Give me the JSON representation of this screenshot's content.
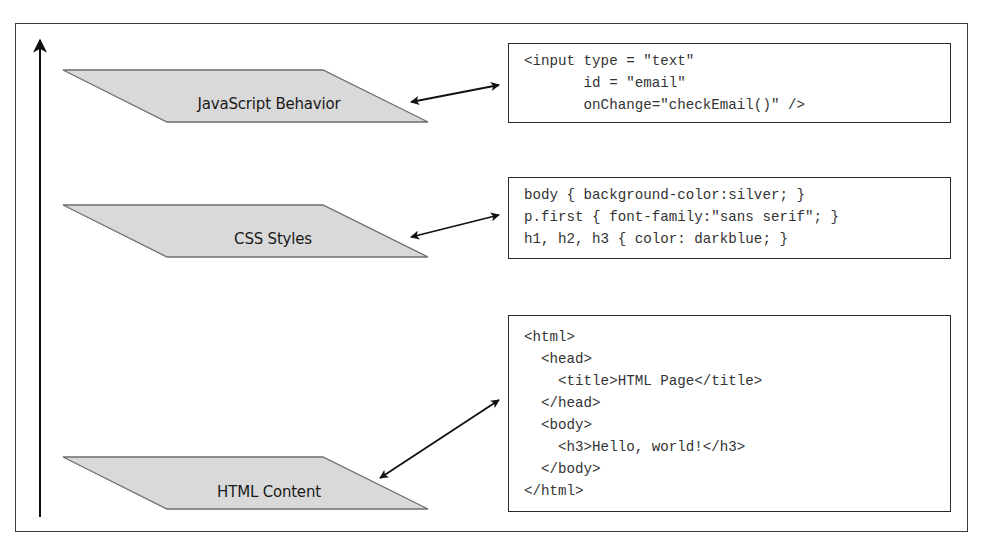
{
  "diagram": {
    "axis": {
      "direction": "up"
    },
    "layers": [
      {
        "id": "javascript",
        "label": "JavaScript Behavior",
        "code_lines": [
          "<input type = \"text\"",
          "       id = \"email\"",
          "       onChange=\"checkEmail()\" />"
        ]
      },
      {
        "id": "css",
        "label": "CSS Styles",
        "code_lines": [
          "body { background-color:silver; }",
          "p.first { font-family:\"sans serif\"; }",
          "h1, h2, h3 { color: darkblue; }"
        ]
      },
      {
        "id": "html",
        "label": "HTML Content",
        "code_lines": [
          "<html>",
          "  <head>",
          "    <title>HTML Page</title>",
          "  </head>",
          "  <body>",
          "    <h3>Hello, world!</h3>",
          "  </body>",
          "</html>"
        ]
      }
    ],
    "colors": {
      "layer_fill": "#d9d9d9",
      "layer_stroke": "#6e6e6e",
      "line": "#111111",
      "code_text": "#333333"
    }
  }
}
